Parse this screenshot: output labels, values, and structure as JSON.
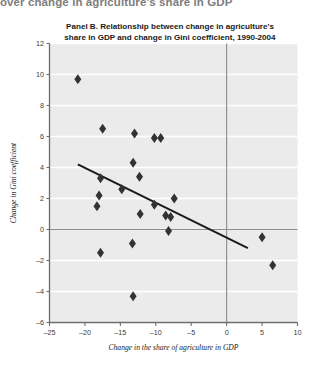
{
  "header": {
    "cut_off_text": "over change in agriculture's share in GDP"
  },
  "chart_data": {
    "type": "scatter",
    "title_line1": "Panel B. Relationship between change in agriculture's",
    "title_line2": "share in GDP and change in Gini coefficient, 1990-2004",
    "xlabel": "Change in the share of agriculture in GDP",
    "ylabel": "Change in Gini coefficient",
    "xlim": [
      -25,
      10
    ],
    "ylim": [
      -6,
      12
    ],
    "xticks": [
      -25,
      -20,
      -15,
      -10,
      -5,
      0,
      5,
      10
    ],
    "xtick_labels": [
      "–25",
      "–20",
      "–15",
      "–10",
      "–5",
      "0",
      "5",
      "10"
    ],
    "yticks": [
      -6,
      -4,
      -2,
      0,
      2,
      4,
      6,
      8,
      10,
      12
    ],
    "ytick_labels": [
      "–6",
      "–4",
      "–2",
      "0",
      "2",
      "4",
      "6",
      "8",
      "10",
      "12"
    ],
    "grid": "horizontal-white",
    "legend": "none",
    "marker": "diamond",
    "marker_color": "#333333",
    "plot_bg": "#ebebeb",
    "gridline_color": "#ffffff",
    "points": [
      {
        "x": -21.0,
        "y": 9.7
      },
      {
        "x": -17.5,
        "y": 6.5
      },
      {
        "x": -13.0,
        "y": 6.2
      },
      {
        "x": -10.2,
        "y": 5.9
      },
      {
        "x": -9.3,
        "y": 5.9
      },
      {
        "x": -13.2,
        "y": 4.3
      },
      {
        "x": -17.8,
        "y": 3.3
      },
      {
        "x": -12.3,
        "y": 3.4
      },
      {
        "x": -18.0,
        "y": 2.2
      },
      {
        "x": -14.8,
        "y": 2.6
      },
      {
        "x": -10.2,
        "y": 1.6
      },
      {
        "x": -18.3,
        "y": 1.5
      },
      {
        "x": -7.4,
        "y": 2.0
      },
      {
        "x": -12.2,
        "y": 1.0
      },
      {
        "x": -8.6,
        "y": 0.9
      },
      {
        "x": -7.9,
        "y": 0.8
      },
      {
        "x": -8.2,
        "y": -0.1
      },
      {
        "x": -17.8,
        "y": -1.5
      },
      {
        "x": -13.3,
        "y": -0.9
      },
      {
        "x": -13.2,
        "y": -4.3
      },
      {
        "x": 5.0,
        "y": -0.5
      },
      {
        "x": 6.5,
        "y": -2.3
      }
    ],
    "trendline": {
      "x_start": -21.0,
      "y_start": 4.2,
      "x_end": 3.0,
      "y_end": -1.2,
      "color": "#1a1a1a",
      "width": 2.0
    }
  }
}
